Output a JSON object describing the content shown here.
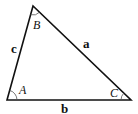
{
  "diagram": {
    "type": "triangle",
    "vertices": {
      "A": [
        7,
        100
      ],
      "B": [
        33,
        6
      ],
      "C": [
        131,
        100
      ]
    },
    "angle_labels": {
      "A": "A",
      "B": "B",
      "C": "C"
    },
    "side_labels": {
      "a": "a",
      "b": "b",
      "c": "c"
    },
    "stroke_color": "#111111"
  }
}
